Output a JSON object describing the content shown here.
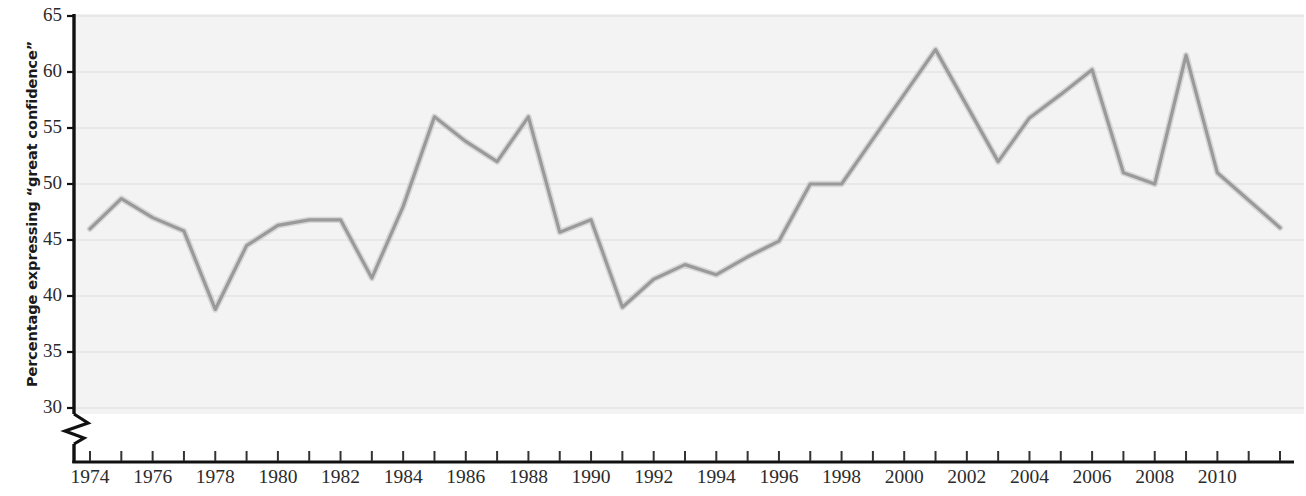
{
  "chart_data": {
    "type": "line",
    "title": "",
    "subtitle": "",
    "xlabel": "",
    "ylabel": "Percentage expressing “great confidence”",
    "xlim": [
      1974,
      2012
    ],
    "ylim": [
      28.5,
      65
    ],
    "grid": true,
    "grid_axis": "y",
    "legend": false,
    "axis_break": {
      "axis": "y",
      "below": 30,
      "symbol": "zigzag"
    },
    "yticks": [
      30,
      35,
      40,
      45,
      50,
      55,
      60,
      65
    ],
    "ytick_labels": [
      "30",
      "35",
      "40",
      "45",
      "50",
      "55",
      "60",
      "65"
    ],
    "xtick_labels": [
      "1974",
      "1976",
      "1978",
      "1980",
      "1982",
      "1984",
      "1986",
      "1988",
      "1990",
      "1992",
      "1994",
      "1996",
      "1998",
      "2000",
      "2002",
      "2004",
      "2006",
      "2008",
      "2010"
    ],
    "xtick_values": [
      1974,
      1976,
      1978,
      1980,
      1982,
      1984,
      1986,
      1988,
      1990,
      1992,
      1994,
      1996,
      1998,
      2000,
      2002,
      2004,
      2006,
      2008,
      2010
    ],
    "xtick_minor_values": [
      1974,
      1975,
      1976,
      1977,
      1978,
      1979,
      1980,
      1981,
      1982,
      1983,
      1984,
      1985,
      1986,
      1987,
      1988,
      1989,
      1990,
      1991,
      1992,
      1993,
      1994,
      1995,
      1996,
      1997,
      1998,
      1999,
      2000,
      2001,
      2002,
      2003,
      2004,
      2005,
      2006,
      2007,
      2008,
      2009,
      2010,
      2011,
      2012
    ],
    "series": [
      {
        "name": "Percentage expressing “great confidence”",
        "color": "#9a9a9a",
        "line_width": 3.2,
        "x": [
          1974,
          1975,
          1976,
          1977,
          1978,
          1979,
          1980,
          1981,
          1982,
          1983,
          1984,
          1985,
          1986,
          1987,
          1988,
          1989,
          1990,
          1991,
          1992,
          1993,
          1994,
          1995,
          1996,
          1997,
          1998,
          1999,
          2000,
          2001,
          2002,
          2003,
          2004,
          2005,
          2006,
          2007,
          2008,
          2009,
          2010,
          2012
        ],
        "y": [
          46.0,
          48.7,
          47.0,
          45.8,
          38.8,
          44.5,
          46.3,
          46.8,
          46.8,
          41.6,
          48.0,
          56.0,
          53.8,
          52.0,
          56.0,
          45.7,
          46.8,
          39.0,
          41.5,
          42.8,
          41.9,
          43.5,
          44.9,
          50.0,
          50.0,
          54.0,
          58.0,
          62.0,
          57.0,
          52.0,
          55.9,
          58.0,
          60.2,
          51.0,
          50.0,
          61.5,
          51.0,
          46.1
        ]
      }
    ],
    "background_color": "#f2f3f2",
    "gridline_color": "#dcdedc",
    "axis_color": "#111111"
  },
  "axis": {
    "y_title": "Percentage expressing “great confidence”"
  }
}
